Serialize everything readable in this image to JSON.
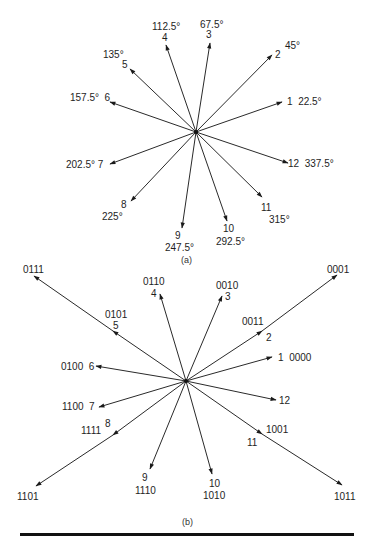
{
  "figure": {
    "part_a": {
      "caption": "(a)",
      "center": [
        196,
        132
      ],
      "vectors": [
        {
          "index": "1",
          "angle": "22.5°",
          "tip": [
            282,
            102
          ]
        },
        {
          "index": "2",
          "angle": "45°",
          "tip": [
            272,
            55
          ]
        },
        {
          "index": "3",
          "angle": "67.5°",
          "tip": [
            210,
            43
          ]
        },
        {
          "index": "4",
          "angle": "112.5°",
          "tip": [
            166,
            45
          ]
        },
        {
          "index": "5",
          "angle": "135°",
          "tip": [
            130,
            69
          ]
        },
        {
          "index": "6",
          "angle": "157.5°",
          "tip": [
            110,
            102
          ]
        },
        {
          "index": "7",
          "angle": "202.5°",
          "tip": [
            110,
            164
          ]
        },
        {
          "index": "8",
          "angle": "225°",
          "tip": [
            131,
            201
          ]
        },
        {
          "index": "9",
          "angle": "247.5°",
          "tip": [
            182,
            228
          ]
        },
        {
          "index": "10",
          "angle": "292.5°",
          "tip": [
            227,
            221
          ]
        },
        {
          "index": "11",
          "angle": "315°",
          "tip": [
            262,
            197
          ]
        },
        {
          "index": "12",
          "angle": "337.5°",
          "tip": [
            288,
            163
          ]
        }
      ]
    },
    "part_b": {
      "caption": "(b)",
      "center": [
        186,
        381
      ],
      "vectors": [
        {
          "index": "1",
          "code": "0000",
          "tip": [
            272,
            357
          ]
        },
        {
          "index": "2",
          "code": "0011",
          "tip": [
            262,
            331
          ],
          "outer_code": "0001",
          "outer_tip": [
            337,
            275
          ]
        },
        {
          "index": "3",
          "code": "0010",
          "tip": [
            222,
            296
          ]
        },
        {
          "index": "4",
          "code": "0110",
          "tip": [
            160,
            294
          ]
        },
        {
          "index": "5",
          "code": "0101",
          "tip": [
            113,
            331
          ],
          "outer_code": "0111",
          "outer_tip": [
            34,
            276
          ]
        },
        {
          "index": "6",
          "code": "0100",
          "tip": [
            96,
            366
          ]
        },
        {
          "index": "7",
          "code": "1100",
          "tip": [
            99,
            407
          ]
        },
        {
          "index": "8",
          "code": "1111",
          "tip": [
            113,
            435
          ],
          "outer_code": "1101",
          "outer_tip": [
            36,
            486
          ]
        },
        {
          "index": "9",
          "code": "1110",
          "tip": [
            150,
            469
          ]
        },
        {
          "index": "10",
          "code": "1010",
          "tip": [
            212,
            474
          ]
        },
        {
          "index": "11",
          "code": "1001",
          "tip": [
            262,
            434
          ],
          "outer_code": "1011",
          "outer_tip": [
            342,
            485
          ]
        },
        {
          "index": "12",
          "code": "",
          "tip": [
            276,
            400
          ]
        }
      ]
    },
    "colors": {
      "line": "#2a2a2a",
      "text": "#1e1e1e",
      "rule": "#111111"
    }
  }
}
